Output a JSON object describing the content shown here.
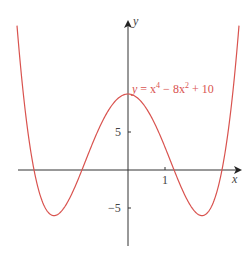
{
  "chart_data": {
    "type": "line",
    "title": "",
    "equation_label": "y = x⁴ − 8x² + 10",
    "xlabel": "x",
    "ylabel": "y",
    "x_ticks": [
      {
        "value": 1,
        "label": "1"
      }
    ],
    "y_ticks": [
      {
        "value": 5,
        "label": "5"
      },
      {
        "value": -5,
        "label": "−5"
      }
    ],
    "xlim": [
      -3.0,
      3.0
    ],
    "ylim": [
      -10,
      19
    ],
    "grid": false,
    "series": [
      {
        "name": "y = x^4 - 8x^2 + 10",
        "color": "#d9534f",
        "function": "x^4 - 8x^2 + 10",
        "x": [
          -3,
          -2.5,
          -2,
          -1.5,
          -1,
          -0.5,
          0,
          0.5,
          1,
          1.5,
          2,
          2.5,
          3
        ],
        "y": [
          19,
          -0.94,
          -6,
          -2.94,
          3,
          8.06,
          10,
          8.06,
          3,
          -2.94,
          -6,
          -0.94,
          19
        ]
      }
    ]
  },
  "labels": {
    "x_axis": "x",
    "y_axis": "y",
    "tick_x1": "1",
    "tick_y5": "5",
    "tick_yneg5": "−5",
    "eq_y": "y",
    "eq_mid1": " = x",
    "eq_exp4": "4",
    "eq_mid2": " − 8x",
    "eq_exp2": "2",
    "eq_end": " + 10"
  }
}
